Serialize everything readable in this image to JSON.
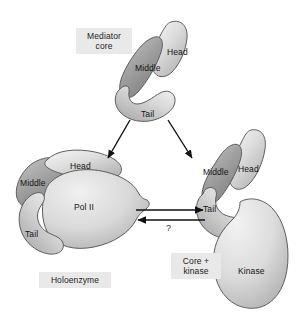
{
  "figure": {
    "background": "#ffffff",
    "colors": {
      "light_lobe": "#dcdcdc",
      "dark_lobe": "#9b9b9b",
      "mid_lobe": "#c9c9c9",
      "outline": "#5a5a5a",
      "label_box_bg": "#e9e9e9",
      "text": "#141414",
      "arrow": "#111111"
    }
  },
  "complexes": [
    {
      "id": "mediator-core",
      "box_label": "Mediator\ncore",
      "subunits": [
        {
          "name": "Head",
          "shade": "light"
        },
        {
          "name": "Middle",
          "shade": "dark"
        },
        {
          "name": "Tail",
          "shade": "light"
        }
      ]
    },
    {
      "id": "holoenzyme",
      "box_label": "Holoenzyme",
      "subunits": [
        {
          "name": "Head",
          "shade": "light"
        },
        {
          "name": "Middle",
          "shade": "dark"
        },
        {
          "name": "Tail",
          "shade": "light"
        },
        {
          "name": "Pol II",
          "shade": "light"
        }
      ]
    },
    {
      "id": "core-plus-kinase",
      "box_label": "Core +\nkinase",
      "subunits": [
        {
          "name": "Head",
          "shade": "light"
        },
        {
          "name": "Middle",
          "shade": "dark"
        },
        {
          "name": "Tail",
          "shade": "light"
        },
        {
          "name": "Kinase",
          "shade": "light"
        }
      ]
    }
  ],
  "labels": {
    "mediator_core_box": "Mediator\ncore",
    "holoenzyme_box": "Holoenzyme",
    "core_kinase_box": "Core +\nkinase",
    "head_top": "Head",
    "middle_top": "Middle",
    "tail_top": "Tail",
    "head_left": "Head",
    "middle_left": "Middle",
    "tail_left": "Tail",
    "pol_ii": "Pol II",
    "head_right": "Head",
    "middle_right": "Middle",
    "tail_right": "Tail",
    "kinase": "Kinase",
    "question_mark": "?"
  },
  "arrows": [
    {
      "id": "core-to-holoenzyme",
      "from": "mediator-core",
      "to": "holoenzyme",
      "direction": "down-left",
      "head": "single"
    },
    {
      "id": "core-to-kinase",
      "from": "mediator-core",
      "to": "core-plus-kinase",
      "direction": "down-right",
      "head": "single"
    },
    {
      "id": "holo-to-kinase",
      "from": "holoenzyme",
      "to": "core-plus-kinase",
      "direction": "right",
      "head": "single"
    },
    {
      "id": "kinase-to-holo",
      "from": "core-plus-kinase",
      "to": "holoenzyme",
      "direction": "left",
      "head": "single"
    }
  ]
}
